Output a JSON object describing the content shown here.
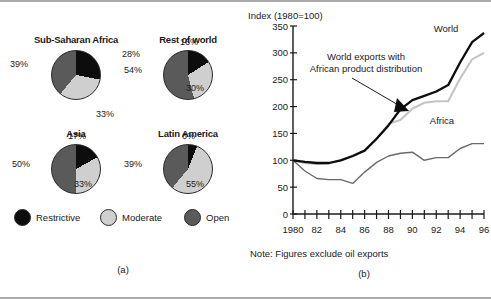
{
  "figure": {
    "panel_a_caption": "(a)",
    "panel_b_caption": "(b)"
  },
  "pies": {
    "legend": [
      {
        "label": "Restrictive",
        "color": "#0d0d0d",
        "key": "restrictive"
      },
      {
        "label": "Moderate",
        "color": "#cfcfcf",
        "key": "moderate"
      },
      {
        "label": "Open",
        "color": "#5a5a5a",
        "key": "open"
      }
    ],
    "charts": [
      {
        "title": "Sub-Saharan Africa",
        "restrictive": 28,
        "moderate": 33,
        "open": 39,
        "restrictive_label": "28%",
        "moderate_label": "33%",
        "open_label": "39%"
      },
      {
        "title": "Rest of world",
        "restrictive": 16,
        "moderate": 30,
        "open": 54,
        "restrictive_label": "16%",
        "moderate_label": "30%",
        "open_label": "54%"
      },
      {
        "title": "Asia",
        "restrictive": 17,
        "moderate": 33,
        "open": 50,
        "restrictive_label": "17%",
        "moderate_label": "33%",
        "open_label": "50%"
      },
      {
        "title": "Latin America",
        "restrictive": 6,
        "moderate": 55,
        "open": 39,
        "restrictive_label": "6%",
        "moderate_label": "55%",
        "open_label": "39%"
      }
    ]
  },
  "line_chart": {
    "axis_title": "Index (1980=100)",
    "note": "Note: Figures exclude oil exports",
    "annotation": [
      "World exports with",
      "African product distribution"
    ],
    "series_labels": {
      "world": "World",
      "africa": "Africa"
    }
  },
  "chart_data": {
    "type": "line",
    "title": "Index (1980=100)",
    "xlabel": "",
    "ylabel": "Index (1980=100)",
    "ylim": [
      0,
      350
    ],
    "yticks": [
      0,
      50,
      100,
      150,
      200,
      250,
      300,
      350
    ],
    "ytick_labels": [
      "0",
      "50",
      "100",
      "150",
      "200",
      "250",
      "300",
      "350"
    ],
    "x": [
      1980,
      1981,
      1982,
      1983,
      1984,
      1985,
      1986,
      1987,
      1988,
      1989,
      1990,
      1991,
      1992,
      1993,
      1994,
      1995,
      1996
    ],
    "xtick_labels": [
      "1980",
      "",
      "82",
      "",
      "84",
      "",
      "86",
      "",
      "88",
      "",
      "90",
      "",
      "92",
      "",
      "94",
      "",
      "96"
    ],
    "xlim": [
      1980,
      1996
    ],
    "grid": false,
    "legend": "inline-labels",
    "series": [
      {
        "name": "World",
        "color": "#0d0d0d",
        "values": [
          100,
          97,
          95,
          95,
          100,
          108,
          118,
          140,
          165,
          195,
          212,
          220,
          228,
          240,
          282,
          320,
          337
        ]
      },
      {
        "name": "World exports with African product distribution",
        "color": "#c4c4c4",
        "values": [
          100,
          95,
          93,
          94,
          100,
          108,
          118,
          140,
          168,
          175,
          196,
          207,
          210,
          210,
          252,
          288,
          300
        ]
      },
      {
        "name": "Africa",
        "color": "#6a6a6a",
        "values": [
          100,
          80,
          66,
          64,
          64,
          57,
          78,
          96,
          108,
          113,
          115,
          100,
          105,
          105,
          122,
          131,
          131
        ]
      }
    ],
    "annotations": [
      {
        "text": "World exports with African product distribution",
        "points_to_year": 1991,
        "points_to_value": 210
      },
      {
        "text": "World",
        "at_year": 1995,
        "at_value": 345
      },
      {
        "text": "Africa",
        "at_year": 1993,
        "at_value": 165
      }
    ]
  }
}
